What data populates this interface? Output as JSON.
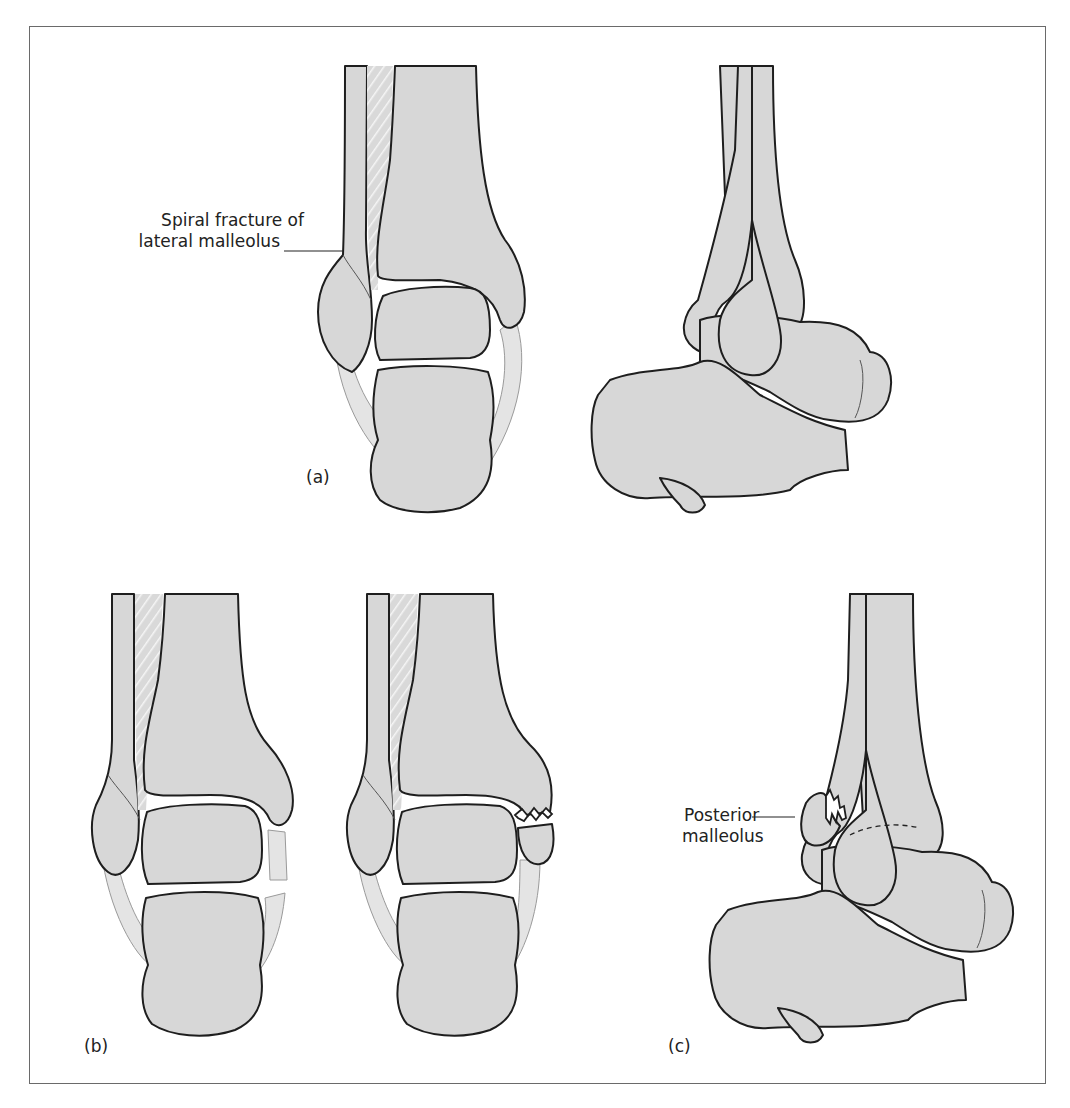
{
  "figure": {
    "panels": [
      {
        "id": "a",
        "label": "(a)",
        "views": [
          "anterior view of ankle",
          "lateral view of ankle"
        ]
      },
      {
        "id": "b",
        "label": "(b)",
        "views": [
          "anterior view with ligament rupture",
          "anterior view with medial malleolus fracture"
        ]
      },
      {
        "id": "c",
        "label": "(c)",
        "views": [
          "lateral view with posterior malleolus fracture"
        ]
      }
    ],
    "annotations": {
      "spiral_fracture": {
        "line1": "Spiral fracture of",
        "line2": "lateral malleolus"
      },
      "posterior_malleolus": {
        "line1": "Posterior",
        "line2": "malleolus"
      }
    },
    "colors": {
      "bone_fill": "#d7d7d7",
      "outline": "#1e1e1e",
      "frame": "#6a6a6a",
      "background": "#ffffff"
    }
  }
}
